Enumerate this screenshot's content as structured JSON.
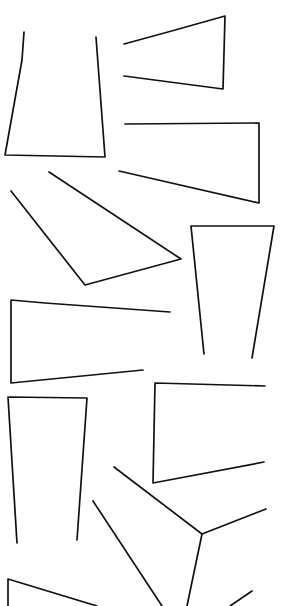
{
  "canvas": {
    "width": 281,
    "height": 606,
    "background": "#ffffff",
    "stroke_color": "#111111",
    "stroke_width": 1.7
  },
  "shapes": [
    {
      "name": "open-trapezoid-top-left",
      "points": [
        [
          24,
          32
        ],
        [
          22,
          60
        ],
        [
          5,
          155
        ],
        [
          105,
          157
        ],
        [
          96,
          37
        ]
      ]
    },
    {
      "name": "open-angle-top-right",
      "points": [
        [
          124,
          44
        ],
        [
          168,
          32
        ],
        [
          225,
          16
        ],
        [
          223,
          89
        ],
        [
          124,
          76
        ]
      ]
    },
    {
      "name": "open-bracket-right-1",
      "points": [
        [
          125,
          124
        ],
        [
          259,
          123
        ],
        [
          259,
          203
        ],
        [
          119,
          171
        ]
      ]
    },
    {
      "name": "open-quad-diagonal",
      "points": [
        [
          49,
          172
        ],
        [
          181,
          259
        ],
        [
          85,
          285
        ],
        [
          11,
          191
        ]
      ]
    },
    {
      "name": "open-trapezoid-right-tall",
      "points": [
        [
          204,
          354
        ],
        [
          191,
          226
        ],
        [
          274,
          226
        ],
        [
          252,
          358
        ]
      ]
    },
    {
      "name": "open-bracket-left-middle",
      "points": [
        [
          170,
          312
        ],
        [
          45,
          303
        ],
        [
          11,
          300
        ],
        [
          11,
          383
        ],
        [
          143,
          370
        ]
      ]
    },
    {
      "name": "open-bracket-right-2",
      "points": [
        [
          265,
          386
        ],
        [
          155,
          383
        ],
        [
          153,
          483
        ],
        [
          264,
          462
        ]
      ]
    },
    {
      "name": "open-trapezoid-left-tall",
      "points": [
        [
          17,
          543
        ],
        [
          8,
          397
        ],
        [
          87,
          398
        ],
        [
          77,
          540
        ]
      ]
    },
    {
      "name": "open-angle-bottom-middle",
      "points": [
        [
          114,
          467
        ],
        [
          202,
          534
        ],
        [
          266,
          509
        ]
      ]
    },
    {
      "name": "open-angle-bottom-line-1",
      "points": [
        [
          93,
          501
        ],
        [
          162,
          606
        ]
      ]
    },
    {
      "name": "open-angle-bottom-line-2",
      "points": [
        [
          202,
          534
        ],
        [
          187,
          606
        ]
      ]
    },
    {
      "name": "open-angle-bottom-left",
      "points": [
        [
          8,
          606
        ],
        [
          8,
          579
        ],
        [
          97,
          606
        ]
      ]
    },
    {
      "name": "stroke-fragment-bottom-right",
      "points": [
        [
          230,
          606
        ],
        [
          252,
          591
        ]
      ]
    }
  ]
}
